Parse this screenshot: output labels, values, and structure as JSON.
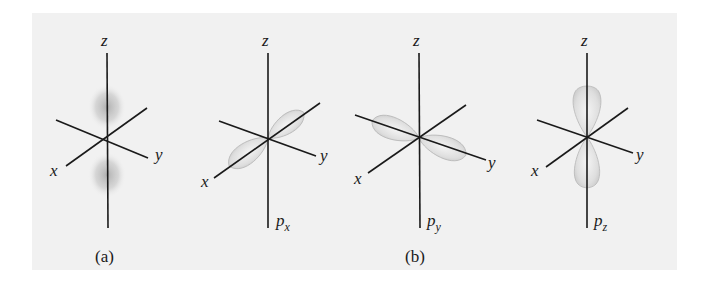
{
  "figure": {
    "panel_background": "#f1f1f1",
    "axis_labels": {
      "x": "x",
      "y": "y",
      "z": "z"
    },
    "panels": [
      {
        "id": "s",
        "caption": "(a)",
        "orbital_label": "",
        "orbital_subscript": ""
      },
      {
        "id": "px",
        "caption": "",
        "orbital_label": "p",
        "orbital_subscript": "x"
      },
      {
        "id": "py",
        "caption": "(b)",
        "orbital_label": "p",
        "orbital_subscript": "y"
      },
      {
        "id": "pz",
        "caption": "",
        "orbital_label": "p",
        "orbital_subscript": "z"
      }
    ]
  }
}
